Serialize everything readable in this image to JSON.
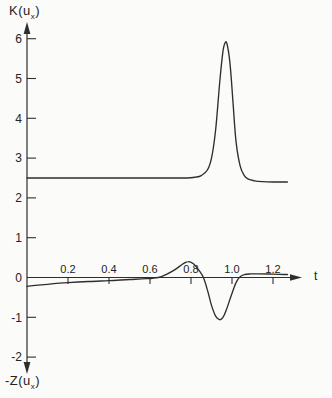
{
  "figure": {
    "top_axis_label": {
      "pre": "K(u",
      "sub": "x",
      "post": ")"
    },
    "bottom_axis_label": {
      "pre": "-Z(u",
      "sub": "x",
      "post": ")"
    },
    "x_axis_label": "t"
  },
  "colors": {
    "line": "#2e2e2e",
    "text": "#232323",
    "background": "#fbfbf9"
  },
  "chart_data": {
    "type": "line",
    "title": "",
    "xlabel": "t",
    "ylabel_top": "K(u_x)",
    "ylabel_bottom": "-Z(u_x)",
    "xlim": [
      0,
      1.34
    ],
    "ylim": [
      -2.4,
      6.35
    ],
    "grid": false,
    "legend": "none",
    "x_ticks": [
      {
        "v": 0.2,
        "label": "0.2"
      },
      {
        "v": 0.4,
        "label": "0.4"
      },
      {
        "v": 0.6,
        "label": "0.6"
      },
      {
        "v": 0.8,
        "label": "0.8"
      },
      {
        "v": 1.0,
        "label": "1.0"
      },
      {
        "v": 1.2,
        "label": "1.2"
      }
    ],
    "y_ticks": [
      {
        "v": 6,
        "label": "6",
        "mark": true
      },
      {
        "v": 5,
        "label": "5",
        "mark": true
      },
      {
        "v": 4,
        "label": "4",
        "mark": true
      },
      {
        "v": 3,
        "label": "3",
        "mark": true
      },
      {
        "v": 2,
        "label": "2",
        "mark": true
      },
      {
        "v": 1,
        "label": "1",
        "mark": true
      },
      {
        "v": 0,
        "label": "0",
        "mark": false
      },
      {
        "v": -1,
        "label": "-1",
        "mark": true
      },
      {
        "v": -2,
        "label": "-2",
        "mark": true
      }
    ],
    "series": [
      {
        "name": "K(u_x)",
        "points": [
          [
            0,
            2.5
          ],
          [
            0.1,
            2.5
          ],
          [
            0.2,
            2.5
          ],
          [
            0.3,
            2.5
          ],
          [
            0.4,
            2.5
          ],
          [
            0.5,
            2.5
          ],
          [
            0.6,
            2.5
          ],
          [
            0.7,
            2.5
          ],
          [
            0.78,
            2.5
          ],
          [
            0.82,
            2.52
          ],
          [
            0.85,
            2.56
          ],
          [
            0.88,
            2.7
          ],
          [
            0.9,
            3.0
          ],
          [
            0.92,
            3.7
          ],
          [
            0.94,
            4.9
          ],
          [
            0.955,
            5.65
          ],
          [
            0.965,
            5.88
          ],
          [
            0.975,
            5.88
          ],
          [
            0.99,
            5.4
          ],
          [
            1.005,
            4.4
          ],
          [
            1.02,
            3.4
          ],
          [
            1.04,
            2.8
          ],
          [
            1.06,
            2.56
          ],
          [
            1.08,
            2.47
          ],
          [
            1.11,
            2.43
          ],
          [
            1.15,
            2.41
          ],
          [
            1.2,
            2.4
          ],
          [
            1.27,
            2.4
          ]
        ]
      },
      {
        "name": "-Z(u_x)",
        "points": [
          [
            0,
            -0.22
          ],
          [
            0.1,
            -0.17
          ],
          [
            0.2,
            -0.13
          ],
          [
            0.3,
            -0.1
          ],
          [
            0.4,
            -0.08
          ],
          [
            0.5,
            -0.05
          ],
          [
            0.58,
            -0.03
          ],
          [
            0.64,
            0.0
          ],
          [
            0.68,
            0.08
          ],
          [
            0.72,
            0.19
          ],
          [
            0.76,
            0.34
          ],
          [
            0.785,
            0.4
          ],
          [
            0.81,
            0.35
          ],
          [
            0.84,
            0.17
          ],
          [
            0.862,
            -0.02
          ],
          [
            0.882,
            -0.35
          ],
          [
            0.9,
            -0.7
          ],
          [
            0.92,
            -0.97
          ],
          [
            0.94,
            -1.06
          ],
          [
            0.955,
            -1.01
          ],
          [
            0.97,
            -0.85
          ],
          [
            0.99,
            -0.55
          ],
          [
            1.01,
            -0.25
          ],
          [
            1.025,
            -0.08
          ],
          [
            1.04,
            0.02
          ],
          [
            1.06,
            0.07
          ],
          [
            1.09,
            0.09
          ],
          [
            1.13,
            0.09
          ],
          [
            1.18,
            0.088
          ],
          [
            1.23,
            0.08
          ],
          [
            1.27,
            0.075
          ]
        ]
      }
    ]
  }
}
